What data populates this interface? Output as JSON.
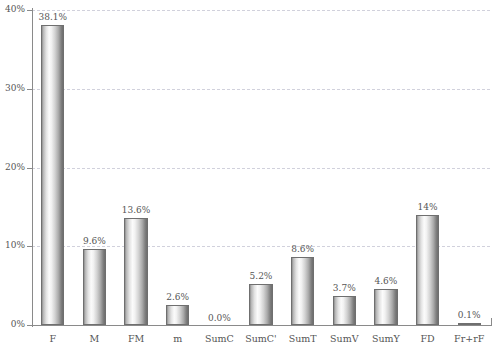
{
  "chart_data": {
    "type": "bar",
    "title": "",
    "subtitle": "",
    "xlabel": "",
    "ylabel": "",
    "categories": [
      "F",
      "M",
      "FM",
      "m",
      "SumC",
      "SumC'",
      "SumT",
      "SumV",
      "SumY",
      "FD",
      "Fr+rF"
    ],
    "values": [
      38.1,
      9.6,
      13.6,
      2.6,
      0.0,
      5.2,
      8.6,
      3.7,
      4.6,
      14.0,
      0.1
    ],
    "data_labels": [
      "38.1%",
      "9.6%",
      "13.6%",
      "2.6%",
      "0.0%",
      "5.2%",
      "8.6%",
      "3.7%",
      "4.6%",
      "14%",
      "0.1%"
    ],
    "ylim": [
      0,
      40
    ],
    "ytick_values": [
      0,
      10,
      20,
      30,
      40
    ],
    "ytick_labels": [
      "0%",
      "10%",
      "20%",
      "30%",
      "40%"
    ],
    "grid": true,
    "grid_axis": "y",
    "legend": false,
    "legend_position": "none",
    "bar_style": "cylinder-gradient",
    "colors": {
      "bar_light": "#fbfbfb",
      "bar_mid": "#d2d2d2",
      "bar_dark": "#6e6e6e",
      "bar_outline": "#6f6f6f",
      "gridline": "#c9c9d6",
      "axis": "#8a8a8a",
      "text": "#555555",
      "background": "#ffffff"
    }
  }
}
